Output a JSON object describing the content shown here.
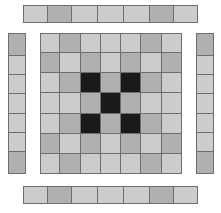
{
  "figure": {
    "canvas": {
      "width": 221,
      "height": 213,
      "background": "#ffffff"
    }
  },
  "palette": {
    "light": "#cccccc",
    "medium": "#b0b0b0",
    "dark": "#1a1a1a",
    "stroke": "#6e6e6e",
    "background": "#ffffff"
  },
  "legend": {
    "light_label": "light",
    "medium_label": "medium",
    "dark_label": "dark"
  },
  "chart_data": {
    "type": "heatmap",
    "rows": 7,
    "cols": 7,
    "value_colors": {
      "0": "#cccccc",
      "1": "#b0b0b0",
      "2": "#1a1a1a"
    },
    "value_labels": {
      "0": "light",
      "1": "medium",
      "2": "dark"
    },
    "grid": [
      [
        0,
        1,
        0,
        0,
        0,
        1,
        0
      ],
      [
        1,
        0,
        1,
        0,
        1,
        0,
        1
      ],
      [
        0,
        1,
        2,
        1,
        2,
        1,
        0
      ],
      [
        0,
        0,
        1,
        2,
        1,
        0,
        0
      ],
      [
        0,
        1,
        2,
        1,
        2,
        1,
        0
      ],
      [
        1,
        0,
        1,
        0,
        1,
        0,
        1
      ],
      [
        0,
        1,
        0,
        0,
        0,
        1,
        0
      ]
    ]
  },
  "strips": {
    "top": {
      "name": "top-strip",
      "orientation": "horizontal",
      "cells": [
        0,
        1,
        0,
        0,
        0,
        1,
        0
      ],
      "geometry": {
        "left": 23,
        "top": 5,
        "width": 175,
        "height": 18
      }
    },
    "bottom": {
      "name": "bottom-strip",
      "orientation": "horizontal",
      "cells": [
        0,
        1,
        0,
        0,
        0,
        1,
        0
      ],
      "geometry": {
        "left": 23,
        "top": 186,
        "width": 175,
        "height": 18
      }
    },
    "left": {
      "name": "left-strip",
      "orientation": "vertical",
      "cells": [
        1,
        0,
        0,
        0,
        0,
        0,
        1
      ],
      "geometry": {
        "left": 8,
        "top": 33,
        "width": 18,
        "height": 141
      }
    },
    "right": {
      "name": "right-strip",
      "orientation": "vertical",
      "cells": [
        1,
        0,
        0,
        0,
        0,
        0,
        1
      ],
      "geometry": {
        "left": 196,
        "top": 33,
        "width": 18,
        "height": 141
      }
    }
  },
  "main_grid": {
    "name": "main-grid",
    "geometry": {
      "left": 40,
      "top": 33,
      "width": 142,
      "height": 141
    },
    "rows": 7,
    "cols": 7
  }
}
